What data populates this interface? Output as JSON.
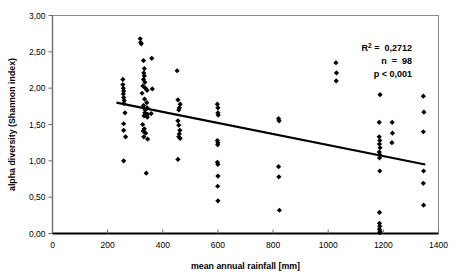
{
  "chart_data": {
    "type": "scatter",
    "title": "",
    "xlabel": "mean annual rainfall [mm]",
    "ylabel": "alpha diversity (Shannon index)",
    "xlim": [
      0,
      1400
    ],
    "ylim": [
      0.0,
      3.0
    ],
    "xticks": [
      0,
      200,
      400,
      600,
      800,
      1000,
      1200,
      1400
    ],
    "xtick_labels": [
      "0",
      "200",
      "400",
      "600",
      "800",
      "1000",
      "1200",
      "1400"
    ],
    "yticks": [
      0.0,
      0.5,
      1.0,
      1.5,
      2.0,
      2.5,
      3.0
    ],
    "ytick_labels": [
      "0,00",
      "0,50",
      "1,00",
      "1,50",
      "2,00",
      "2,50",
      "3,00"
    ],
    "grid": false,
    "legend": false,
    "marker": "filled-diamond",
    "marker_color": "#000000",
    "series": [
      {
        "name": "sites",
        "points": [
          [
            255,
            2.12
          ],
          [
            255,
            2.05
          ],
          [
            257,
            2.0
          ],
          [
            258,
            1.96
          ],
          [
            257,
            1.92
          ],
          [
            258,
            1.87
          ],
          [
            260,
            1.83
          ],
          [
            259,
            1.79
          ],
          [
            263,
            1.66
          ],
          [
            258,
            1.51
          ],
          [
            258,
            1.42
          ],
          [
            265,
            1.33
          ],
          [
            258,
            1.0
          ],
          [
            318,
            2.68
          ],
          [
            320,
            2.63
          ],
          [
            322,
            2.61
          ],
          [
            330,
            2.38
          ],
          [
            333,
            2.27
          ],
          [
            331,
            2.21
          ],
          [
            333,
            2.17
          ],
          [
            330,
            2.12
          ],
          [
            335,
            2.08
          ],
          [
            328,
            2.03
          ],
          [
            337,
            2.0
          ],
          [
            325,
            1.93
          ],
          [
            343,
            1.97
          ],
          [
            334,
            1.85
          ],
          [
            342,
            1.8
          ],
          [
            330,
            1.76
          ],
          [
            343,
            1.73
          ],
          [
            336,
            1.7
          ],
          [
            335,
            1.66
          ],
          [
            345,
            1.64
          ],
          [
            332,
            1.62
          ],
          [
            344,
            1.6
          ],
          [
            327,
            1.5
          ],
          [
            333,
            1.44
          ],
          [
            329,
            1.41
          ],
          [
            338,
            1.38
          ],
          [
            331,
            1.33
          ],
          [
            345,
            1.3
          ],
          [
            340,
            0.83
          ],
          [
            360,
            2.41
          ],
          [
            362,
            1.99
          ],
          [
            358,
            1.65
          ],
          [
            452,
            2.24
          ],
          [
            455,
            1.84
          ],
          [
            463,
            1.78
          ],
          [
            460,
            1.73
          ],
          [
            458,
            1.7
          ],
          [
            455,
            1.55
          ],
          [
            458,
            1.49
          ],
          [
            462,
            1.42
          ],
          [
            460,
            1.37
          ],
          [
            458,
            1.33
          ],
          [
            463,
            1.31
          ],
          [
            455,
            1.02
          ],
          [
            598,
            1.78
          ],
          [
            600,
            1.73
          ],
          [
            600,
            1.66
          ],
          [
            601,
            1.63
          ],
          [
            598,
            1.28
          ],
          [
            600,
            1.25
          ],
          [
            599,
            1.22
          ],
          [
            598,
            0.98
          ],
          [
            600,
            0.95
          ],
          [
            600,
            0.79
          ],
          [
            599,
            0.65
          ],
          [
            600,
            0.45
          ],
          [
            820,
            1.58
          ],
          [
            822,
            1.55
          ],
          [
            820,
            0.92
          ],
          [
            821,
            0.78
          ],
          [
            823,
            0.32
          ],
          [
            1028,
            2.35
          ],
          [
            1030,
            2.21
          ],
          [
            1029,
            2.1
          ],
          [
            1188,
            1.91
          ],
          [
            1185,
            1.53
          ],
          [
            1185,
            1.33
          ],
          [
            1187,
            1.28
          ],
          [
            1186,
            1.23
          ],
          [
            1188,
            1.18
          ],
          [
            1185,
            1.12
          ],
          [
            1188,
            1.08
          ],
          [
            1186,
            1.04
          ],
          [
            1187,
            0.86
          ],
          [
            1186,
            0.29
          ],
          [
            1186,
            0.14
          ],
          [
            1187,
            0.1
          ],
          [
            1186,
            0.06
          ],
          [
            1188,
            0.03
          ],
          [
            1187,
            0.01
          ],
          [
            1232,
            1.53
          ],
          [
            1233,
            1.38
          ],
          [
            1231,
            1.25
          ],
          [
            1345,
            1.89
          ],
          [
            1347,
            1.67
          ],
          [
            1345,
            1.4
          ],
          [
            1346,
            0.86
          ],
          [
            1345,
            0.69
          ],
          [
            1346,
            0.39
          ]
        ]
      }
    ],
    "trendline": {
      "type": "linear",
      "x_start": 232,
      "y_start": 1.8,
      "x_end": 1352,
      "y_end": 0.95,
      "color": "#000000",
      "width": 2.2
    },
    "annotations": {
      "r2_label": "R",
      "r2_sup": "2",
      "r2_value": "=  0,2712",
      "n_text": "n  =  98",
      "p_text": "p < 0,001"
    }
  }
}
